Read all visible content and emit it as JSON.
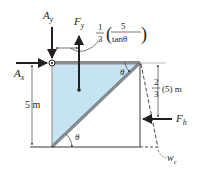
{
  "figure": {
    "forces": {
      "Ay": {
        "symbol": "A",
        "sub": "y"
      },
      "Ax": {
        "symbol": "A",
        "sub": "x"
      },
      "Fy": {
        "symbol": "F",
        "sub": "y"
      },
      "Fh": {
        "symbol": "F",
        "sub": "h"
      }
    },
    "labels": {
      "height": "5 m",
      "moment_arm_frac_num": "1",
      "moment_arm_frac_den": "3",
      "moment_arm_inner_num": "5",
      "moment_arm_inner_den": "tanθ",
      "fh_arm_frac_num": "2",
      "fh_arm_frac_den": "3",
      "fh_arm_rest": "(5) m",
      "theta_top": "θ",
      "theta_bottom": "θ",
      "water_weight": {
        "symbol": "w",
        "sub": "c"
      }
    },
    "colors": {
      "water": "#c6e3f1",
      "gate": "#8a8c8e",
      "ink": "#231f20"
    }
  }
}
